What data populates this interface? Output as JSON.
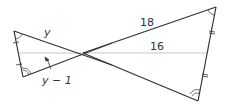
{
  "diagram": {
    "type": "similar-triangles (bowtie)",
    "labels": {
      "left_top_side": "y",
      "left_median": "y − 1",
      "right_top_side": "18",
      "right_median": "16"
    },
    "colors": {
      "line": "#333333",
      "median": "#c8c8c8",
      "background": "#ffffff"
    }
  }
}
